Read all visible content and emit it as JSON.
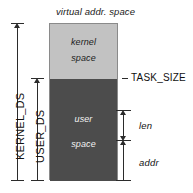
{
  "diagram": {
    "title": "virtual addr. space",
    "regions": [
      {
        "id": "kernel",
        "line1": "kernel",
        "line2": "space",
        "fill": "#c2c2c2",
        "text_color": "#202020"
      },
      {
        "id": "user",
        "line1": "user",
        "line2": "space",
        "fill": "#4c4c4c",
        "text_color": "#f2f2f2"
      }
    ],
    "boundary_markers": [
      {
        "id": "task-size",
        "label": "TASK_SIZE"
      }
    ],
    "left_extents": [
      {
        "id": "kernel-ds",
        "label": "KERNEL_DS"
      },
      {
        "id": "user-ds",
        "label": "USER_DS"
      }
    ],
    "right_extents": [
      {
        "id": "len",
        "label": "len"
      },
      {
        "id": "addr",
        "label": "addr"
      }
    ],
    "stroke_color": "#2b2b2b",
    "background": "#ffffff"
  }
}
